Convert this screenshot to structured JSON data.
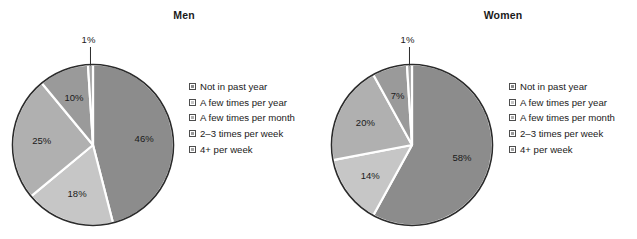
{
  "chart_data": [
    {
      "type": "pie",
      "title": "Men",
      "categories": [
        "Not in past year",
        "A few times per year",
        "A few times per month",
        "2–3 times per week",
        "4+  per week"
      ],
      "values": [
        46,
        18,
        25,
        10,
        1
      ],
      "data_labels": [
        "46%",
        "18%",
        "25%",
        "10%",
        "1%"
      ],
      "units": "percent",
      "legend_position": "right",
      "grid": false,
      "start_angle_deg": 0,
      "direction": "clockwise",
      "colors": [
        "#8c8c8c",
        "#c6c6c6",
        "#b0b0b0",
        "#9a9a9a",
        "#a5a5a5"
      ],
      "separator_color": "#ffffff",
      "outline_color": "#2b2b2b",
      "callout_slice_index": 4
    },
    {
      "type": "pie",
      "title": "Women",
      "categories": [
        "Not in past year",
        "A few times per year",
        "A few times per month",
        "2–3 times per week",
        "4+  per week"
      ],
      "values": [
        58,
        14,
        20,
        7,
        1
      ],
      "data_labels": [
        "58%",
        "14%",
        "20%",
        "7%",
        "1%"
      ],
      "units": "percent",
      "legend_position": "right",
      "grid": false,
      "start_angle_deg": 0,
      "direction": "clockwise",
      "colors": [
        "#8c8c8c",
        "#c6c6c6",
        "#b0b0b0",
        "#9a9a9a",
        "#a5a5a5"
      ],
      "separator_color": "#ffffff",
      "outline_color": "#2b2b2b",
      "callout_slice_index": 4
    }
  ],
  "panels": [
    {
      "id": "men",
      "title": "Men",
      "slices": [
        {
          "label": "46%",
          "value": 46,
          "color": "#8c8c8c"
        },
        {
          "label": "18%",
          "value": 18,
          "color": "#c6c6c6"
        },
        {
          "label": "25%",
          "value": 25,
          "color": "#b0b0b0"
        },
        {
          "label": "10%",
          "value": 10,
          "color": "#9a9a9a"
        },
        {
          "label": "1%",
          "value": 1,
          "color": "#a5a5a5"
        }
      ],
      "legend": [
        {
          "label": "Not in past year",
          "color": "#8c8c8c"
        },
        {
          "label": "A few times per year",
          "color": "#c6c6c6"
        },
        {
          "label": "A few times per month",
          "color": "#b0b0b0"
        },
        {
          "label": "2–3 times per week",
          "color": "#9a9a9a"
        },
        {
          "label": "4+  per week",
          "color": "#a5a5a5"
        }
      ]
    },
    {
      "id": "women",
      "title": "Women",
      "slices": [
        {
          "label": "58%",
          "value": 58,
          "color": "#8c8c8c"
        },
        {
          "label": "14%",
          "value": 14,
          "color": "#c6c6c6"
        },
        {
          "label": "20%",
          "value": 20,
          "color": "#b0b0b0"
        },
        {
          "label": "7%",
          "value": 7,
          "color": "#9a9a9a"
        },
        {
          "label": "1%",
          "value": 1,
          "color": "#a5a5a5"
        }
      ],
      "legend": [
        {
          "label": "Not in past year",
          "color": "#8c8c8c"
        },
        {
          "label": "A few times per year",
          "color": "#c6c6c6"
        },
        {
          "label": "A few times per month",
          "color": "#b0b0b0"
        },
        {
          "label": "2–3 times per week",
          "color": "#9a9a9a"
        },
        {
          "label": "4+  per week",
          "color": "#a5a5a5"
        }
      ]
    }
  ],
  "style": {
    "background": "#ffffff",
    "outline_color": "#2b2b2b",
    "separator_color": "#ffffff",
    "text_color": "#1a1a1a"
  }
}
